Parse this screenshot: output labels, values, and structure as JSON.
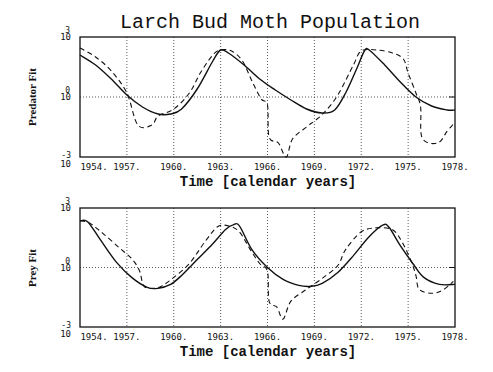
{
  "chart_data": [
    {
      "type": "line",
      "title": "Larch Bud Moth Population",
      "xlabel": "Time [calendar years]",
      "ylabel": "Predator Fit",
      "xlim": [
        1954,
        1978
      ],
      "ylim_log10": [
        -3,
        3
      ],
      "yscale": "log",
      "x_ticks": [
        "1954.",
        "1957.",
        "1960.",
        "1963.",
        "1966.",
        "1969.",
        "1972.",
        "1975.",
        "1978."
      ],
      "y_ticks": [
        {
          "base": "10",
          "exp": "3"
        },
        {
          "base": "10",
          "exp": "0"
        },
        {
          "base": "10",
          "exp": "-3"
        }
      ],
      "grid": true,
      "series": [
        {
          "name": "model",
          "style": "solid",
          "points": [
            [
              1954,
              2.1
            ],
            [
              1955,
              1.6
            ],
            [
              1956,
              0.9
            ],
            [
              1957,
              0.1
            ],
            [
              1958,
              -0.5
            ],
            [
              1959,
              -0.85
            ],
            [
              1959.8,
              -0.85
            ],
            [
              1960.5,
              -0.6
            ],
            [
              1961.5,
              0.4
            ],
            [
              1962.5,
              1.8
            ],
            [
              1963,
              2.35
            ],
            [
              1963.5,
              2.2
            ],
            [
              1964.5,
              1.6
            ],
            [
              1965.5,
              0.9
            ],
            [
              1966.5,
              0.35
            ],
            [
              1967.5,
              -0.15
            ],
            [
              1968.5,
              -0.6
            ],
            [
              1969.5,
              -0.8
            ],
            [
              1970.3,
              -0.65
            ],
            [
              1971,
              0.2
            ],
            [
              1971.7,
              1.4
            ],
            [
              1972.2,
              2.3
            ],
            [
              1972.5,
              2.35
            ],
            [
              1973.5,
              1.6
            ],
            [
              1974.5,
              0.75
            ],
            [
              1975.5,
              0
            ],
            [
              1976.5,
              -0.45
            ],
            [
              1977.5,
              -0.65
            ],
            [
              1978,
              -0.65
            ]
          ]
        },
        {
          "name": "data",
          "style": "dashed",
          "points": [
            [
              1954,
              2.45
            ],
            [
              1955,
              2
            ],
            [
              1956,
              1.3
            ],
            [
              1957,
              0.2
            ],
            [
              1957.7,
              -1.4
            ],
            [
              1958.6,
              -1.4
            ],
            [
              1959,
              -0.95
            ],
            [
              1960,
              -0.6
            ],
            [
              1961,
              0.2
            ],
            [
              1961.7,
              1.2
            ],
            [
              1962.5,
              2.1
            ],
            [
              1963,
              2.35
            ],
            [
              1963.7,
              2.3
            ],
            [
              1964.4,
              1.8
            ],
            [
              1965,
              0.8
            ],
            [
              1965.6,
              -0.1
            ],
            [
              1966,
              -0.4
            ],
            [
              1966.1,
              -2
            ],
            [
              1966.7,
              -2.3
            ],
            [
              1967.2,
              -3
            ],
            [
              1967.6,
              -2.1
            ],
            [
              1968.5,
              -1.5
            ],
            [
              1969,
              -1.2
            ],
            [
              1969.6,
              -0.8
            ],
            [
              1970.5,
              0.1
            ],
            [
              1971.5,
              1.6
            ],
            [
              1972,
              2.3
            ],
            [
              1973,
              2.35
            ],
            [
              1974,
              2.2
            ],
            [
              1974.7,
              1.9
            ],
            [
              1975,
              1.2
            ],
            [
              1975.5,
              0.2
            ],
            [
              1975.8,
              -0.5
            ],
            [
              1975.9,
              -2.05
            ],
            [
              1976.9,
              -2.3
            ],
            [
              1977.5,
              -1.7
            ],
            [
              1977.9,
              -1.35
            ]
          ]
        }
      ]
    },
    {
      "type": "line",
      "title": "",
      "xlabel": "Time [calendar years]",
      "ylabel": "Prey Fit",
      "xlim": [
        1954,
        1978
      ],
      "ylim_log10": [
        -3,
        3
      ],
      "yscale": "log",
      "x_ticks": [
        "1954.",
        "1957.",
        "1960.",
        "1963.",
        "1966.",
        "1969.",
        "1972.",
        "1975.",
        "1978."
      ],
      "y_ticks": [
        {
          "base": "10",
          "exp": "3"
        },
        {
          "base": "10",
          "exp": "0"
        },
        {
          "base": "10",
          "exp": "-3"
        }
      ],
      "grid": true,
      "series": [
        {
          "name": "model",
          "style": "solid",
          "points": [
            [
              1954,
              2.35
            ],
            [
              1954.5,
              2.3
            ],
            [
              1955.3,
              1.4
            ],
            [
              1956.3,
              0.3
            ],
            [
              1957.3,
              -0.5
            ],
            [
              1958.3,
              -1.0
            ],
            [
              1959,
              -1.05
            ],
            [
              1959.8,
              -0.85
            ],
            [
              1960.5,
              -0.4
            ],
            [
              1961.5,
              0.4
            ],
            [
              1962.5,
              1.2
            ],
            [
              1963.3,
              1.9
            ],
            [
              1963.8,
              2.15
            ],
            [
              1964.2,
              2.1
            ],
            [
              1965,
              0.9
            ],
            [
              1966,
              0
            ],
            [
              1967,
              -0.6
            ],
            [
              1968,
              -0.9
            ],
            [
              1968.8,
              -0.95
            ],
            [
              1969.5,
              -0.8
            ],
            [
              1970.5,
              -0.25
            ],
            [
              1971.5,
              0.6
            ],
            [
              1972.5,
              1.55
            ],
            [
              1973.4,
              2.15
            ],
            [
              1973.8,
              2.0
            ],
            [
              1974.5,
              1.1
            ],
            [
              1975.3,
              0.2
            ],
            [
              1976,
              -0.5
            ],
            [
              1977,
              -0.85
            ],
            [
              1978,
              -0.85
            ]
          ]
        },
        {
          "name": "data",
          "style": "dashed",
          "points": [
            [
              1954,
              2.35
            ],
            [
              1954.6,
              2.25
            ],
            [
              1955.5,
              1.7
            ],
            [
              1956.5,
              1.0
            ],
            [
              1957.3,
              0.45
            ],
            [
              1957.8,
              -0.15
            ],
            [
              1958.1,
              -0.95
            ],
            [
              1958.8,
              -1.05
            ],
            [
              1959.3,
              -0.9
            ],
            [
              1960,
              -0.5
            ],
            [
              1961,
              0.2
            ],
            [
              1962,
              1.3
            ],
            [
              1962.8,
              2.05
            ],
            [
              1963.5,
              2.1
            ],
            [
              1964.2,
              1.8
            ],
            [
              1964.9,
              0.9
            ],
            [
              1965.5,
              0.2
            ],
            [
              1966,
              -0.2
            ],
            [
              1966.1,
              -1.7
            ],
            [
              1966.6,
              -2.0
            ],
            [
              1967,
              -2.6
            ],
            [
              1967.5,
              -1.7
            ],
            [
              1968.5,
              -1.1
            ],
            [
              1969.5,
              -0.55
            ],
            [
              1970.5,
              0.1
            ],
            [
              1971,
              0.9
            ],
            [
              1972,
              1.8
            ],
            [
              1973,
              2.0
            ],
            [
              1974,
              1.9
            ],
            [
              1974.6,
              1.3
            ],
            [
              1975.2,
              0.3
            ],
            [
              1975.5,
              -0.4
            ],
            [
              1975.7,
              -1.1
            ],
            [
              1976.5,
              -1.3
            ],
            [
              1977.2,
              -1.15
            ],
            [
              1977.9,
              -0.7
            ]
          ]
        }
      ]
    }
  ],
  "figure": {
    "title": "Larch Bud Moth Population",
    "top_panel": {
      "ylabel": "Predator Fit",
      "xlabel": "Time [calendar years]"
    },
    "bottom_panel": {
      "ylabel": "Prey Fit",
      "xlabel": "Time [calendar years]"
    }
  }
}
